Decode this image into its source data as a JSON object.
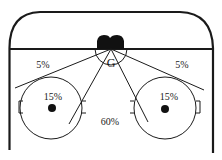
{
  "diagram": {
    "colors": {
      "line": "#1a1a1a",
      "background": "#ffffff"
    },
    "goalie_label": "G",
    "zones": [
      {
        "id": "left-corner",
        "label": "5%"
      },
      {
        "id": "right-corner",
        "label": "5%"
      },
      {
        "id": "left-faceoff",
        "label": "15%"
      },
      {
        "id": "right-faceoff",
        "label": "15%"
      },
      {
        "id": "slot",
        "label": "60%"
      }
    ]
  }
}
